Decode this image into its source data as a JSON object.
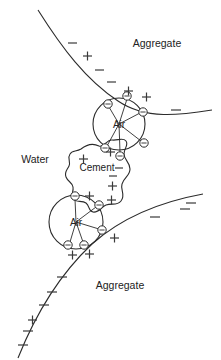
{
  "diagram": {
    "background_color": "#ffffff",
    "line_color": "#2b2b2b",
    "width": 221,
    "height": 360,
    "labels": {
      "aggregate_top": "Aggregate",
      "aggregate_bottom": "Aggregate",
      "water": "Water",
      "cement": "Cement",
      "air_upper": "Air",
      "air_lower": "Air"
    },
    "regions": [
      {
        "name": "aggregate-top",
        "label": "Aggregate",
        "x": 157,
        "y": 47
      },
      {
        "name": "aggregate-bottom",
        "label": "Aggregate",
        "x": 120,
        "y": 289
      },
      {
        "name": "water",
        "label": "Water",
        "x": 35,
        "y": 163
      }
    ],
    "bubbles": [
      {
        "name": "air-bubble-upper",
        "label": "Air",
        "cx": 119,
        "cy": 124,
        "r": 26
      },
      {
        "name": "air-bubble-lower",
        "label": "Air",
        "cx": 76,
        "cy": 222,
        "r": 27
      }
    ],
    "cement_particle": {
      "name": "cement-particle",
      "label": "Cement"
    },
    "surfactant_nodes": [
      {
        "bubble": "upper",
        "cx": 108,
        "cy": 104,
        "glyph": "minus"
      },
      {
        "bubble": "upper",
        "cx": 127,
        "cy": 96,
        "glyph": "minus"
      },
      {
        "bubble": "upper",
        "cx": 143,
        "cy": 112,
        "glyph": "minus"
      },
      {
        "bubble": "upper",
        "cx": 144,
        "cy": 143,
        "glyph": "minus"
      },
      {
        "bubble": "upper",
        "cx": 105,
        "cy": 148,
        "glyph": "minus"
      },
      {
        "bubble": "upper",
        "cx": 120,
        "cy": 156,
        "glyph": "minus"
      },
      {
        "bubble": "lower",
        "cx": 75,
        "cy": 196,
        "glyph": "minus"
      },
      {
        "bubble": "lower",
        "cx": 99,
        "cy": 205,
        "glyph": "minus"
      },
      {
        "bubble": "lower",
        "cx": 102,
        "cy": 230,
        "glyph": "minus"
      },
      {
        "bubble": "lower",
        "cx": 68,
        "cy": 245,
        "glyph": "minus"
      },
      {
        "bubble": "lower",
        "cx": 84,
        "cy": 245,
        "glyph": "minus"
      }
    ],
    "free_charges": [
      {
        "sign": "minus",
        "x": 72,
        "y": 43
      },
      {
        "sign": "plus",
        "x": 87,
        "y": 56
      },
      {
        "sign": "minus",
        "x": 99,
        "y": 70
      },
      {
        "sign": "minus",
        "x": 111,
        "y": 82
      },
      {
        "sign": "plus",
        "x": 128,
        "y": 91
      },
      {
        "sign": "plus",
        "x": 146,
        "y": 97
      },
      {
        "sign": "minus",
        "x": 176,
        "y": 110
      },
      {
        "sign": "plus",
        "x": 83,
        "y": 159
      },
      {
        "sign": "plus",
        "x": 110,
        "y": 152
      },
      {
        "sign": "minus",
        "x": 119,
        "y": 168
      },
      {
        "sign": "minus",
        "x": 113,
        "y": 176
      },
      {
        "sign": "plus",
        "x": 112,
        "y": 186
      },
      {
        "sign": "plus",
        "x": 89,
        "y": 196
      },
      {
        "sign": "plus",
        "x": 111,
        "y": 200
      },
      {
        "sign": "plus",
        "x": 114,
        "y": 238
      },
      {
        "sign": "plus",
        "x": 72,
        "y": 255
      },
      {
        "sign": "plus",
        "x": 89,
        "y": 254
      },
      {
        "sign": "minus",
        "x": 185,
        "y": 209
      },
      {
        "sign": "minus",
        "x": 155,
        "y": 217
      },
      {
        "sign": "minus",
        "x": 191,
        "y": 206
      },
      {
        "sign": "minus",
        "x": 62,
        "y": 277
      },
      {
        "sign": "minus",
        "x": 52,
        "y": 292
      },
      {
        "sign": "minus",
        "x": 44,
        "y": 305
      },
      {
        "sign": "plus",
        "x": 33,
        "y": 320
      },
      {
        "sign": "minus",
        "x": 28,
        "y": 331
      },
      {
        "sign": "minus",
        "x": 23,
        "y": 345
      }
    ]
  }
}
